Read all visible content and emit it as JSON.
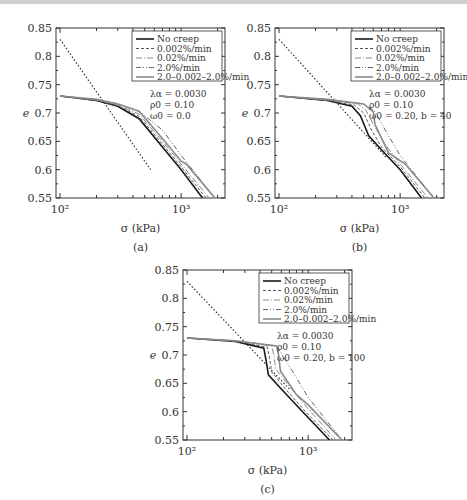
{
  "figure": {
    "panels": [
      {
        "id": "a",
        "caption": "(a)",
        "params": [
          "λα = 0.0030",
          "ρ0 = 0.10",
          "ω0 = 0.0"
        ]
      },
      {
        "id": "b",
        "caption": "(b)",
        "params": [
          "λα = 0.0030",
          "ρ0 = 0.10",
          "ω0 = 0.20, b = 40"
        ]
      },
      {
        "id": "c",
        "caption": "(c)",
        "params": [
          "λα = 0.0030",
          "ρ0 = 0.10",
          "ω0 = 0.20, b = 100"
        ]
      }
    ],
    "xlabel": "σ (kPa)",
    "ylabel": "e",
    "yticks": [
      "0.85",
      "0.8",
      "0.75",
      "0.7",
      "0.65",
      "0.6",
      "0.55"
    ],
    "xticks": [
      "10²",
      "10³"
    ],
    "legend": [
      "No creep",
      "0.002%/min",
      "0.02%/min",
      "2.0%/min",
      "2.0–0.002–2.0%/min"
    ]
  },
  "chart_data": [
    {
      "type": "line",
      "title": "(a) λα = 0.0030, ρ0 = 0.10, ω0 = 0.0",
      "xlabel": "σ (kPa)",
      "ylabel": "e",
      "xscale": "log",
      "xlim": [
        100,
        2300
      ],
      "ylim": [
        0.55,
        0.85
      ],
      "legend_position": "upper right",
      "grid": false,
      "series": [
        {
          "name": "No creep",
          "x": [
            100,
            200,
            300,
            450,
            700,
            1000,
            1500
          ],
          "y": [
            0.73,
            0.722,
            0.712,
            0.69,
            0.64,
            0.6,
            0.55
          ]
        },
        {
          "name": "0.002%/min",
          "x": [
            100,
            200,
            300,
            450,
            700,
            1000,
            1600
          ],
          "y": [
            0.73,
            0.722,
            0.713,
            0.694,
            0.645,
            0.605,
            0.55
          ]
        },
        {
          "name": "0.02%/min",
          "x": [
            100,
            200,
            300,
            450,
            700,
            1000,
            1700
          ],
          "y": [
            0.73,
            0.723,
            0.714,
            0.698,
            0.65,
            0.61,
            0.55
          ]
        },
        {
          "name": "2.0%/min",
          "x": [
            100,
            200,
            300,
            450,
            700,
            1000,
            1900
          ],
          "y": [
            0.73,
            0.724,
            0.716,
            0.703,
            0.67,
            0.625,
            0.55
          ]
        },
        {
          "name": "2.0–0.002–2.0%/min",
          "x": [
            100,
            200,
            300,
            450,
            700,
            1000,
            1100,
            1900
          ],
          "y": [
            0.73,
            0.724,
            0.716,
            0.703,
            0.655,
            0.615,
            0.61,
            0.55
          ]
        }
      ],
      "reference_line": {
        "style": "dotted",
        "x": [
          100,
          560
        ],
        "y": [
          0.83,
          0.6
        ]
      }
    },
    {
      "type": "line",
      "title": "(b) λα = 0.0030, ρ0 = 0.10, ω0 = 0.20, b = 40",
      "xlabel": "σ (kPa)",
      "ylabel": "e",
      "xscale": "log",
      "xlim": [
        100,
        2300
      ],
      "ylim": [
        0.55,
        0.85
      ],
      "legend_position": "upper right",
      "grid": false,
      "series": [
        {
          "name": "No creep",
          "x": [
            100,
            250,
            400,
            470,
            550,
            700,
            1000,
            1500
          ],
          "y": [
            0.73,
            0.722,
            0.712,
            0.695,
            0.66,
            0.635,
            0.6,
            0.55
          ]
        },
        {
          "name": "0.002%/min",
          "x": [
            100,
            250,
            420,
            500,
            580,
            700,
            1000,
            1600
          ],
          "y": [
            0.73,
            0.722,
            0.714,
            0.7,
            0.67,
            0.64,
            0.605,
            0.55
          ]
        },
        {
          "name": "0.02%/min",
          "x": [
            100,
            250,
            450,
            520,
            600,
            750,
            1000,
            1700
          ],
          "y": [
            0.73,
            0.723,
            0.716,
            0.705,
            0.68,
            0.645,
            0.61,
            0.55
          ]
        },
        {
          "name": "2.0%/min",
          "x": [
            100,
            250,
            500,
            620,
            800,
            1000,
            1900
          ],
          "y": [
            0.73,
            0.724,
            0.716,
            0.703,
            0.66,
            0.625,
            0.55
          ]
        },
        {
          "name": "2.0–0.002–2.0%/min",
          "x": [
            100,
            250,
            500,
            600,
            620,
            800,
            1100,
            1900
          ],
          "y": [
            0.73,
            0.724,
            0.716,
            0.702,
            0.68,
            0.63,
            0.61,
            0.55
          ]
        }
      ],
      "reference_line": {
        "style": "dotted",
        "x": [
          100,
          780
        ],
        "y": [
          0.83,
          0.62
        ]
      }
    },
    {
      "type": "line",
      "title": "(c) λα = 0.0030, ρ0 = 0.10, ω0 = 0.20, b = 100",
      "xlabel": "σ (kPa)",
      "ylabel": "e",
      "xscale": "log",
      "xlim": [
        100,
        2300
      ],
      "ylim": [
        0.55,
        0.85
      ],
      "legend_position": "upper right",
      "grid": false,
      "series": [
        {
          "name": "No creep",
          "x": [
            100,
            250,
            430,
            450,
            470,
            600,
            900,
            1500
          ],
          "y": [
            0.73,
            0.724,
            0.712,
            0.69,
            0.665,
            0.64,
            0.6,
            0.55
          ]
        },
        {
          "name": "0.002%/min",
          "x": [
            100,
            250,
            460,
            480,
            500,
            650,
            950,
            1600
          ],
          "y": [
            0.73,
            0.724,
            0.714,
            0.695,
            0.67,
            0.64,
            0.6,
            0.55
          ]
        },
        {
          "name": "0.02%/min",
          "x": [
            100,
            250,
            500,
            520,
            540,
            700,
            1000,
            1700
          ],
          "y": [
            0.73,
            0.725,
            0.716,
            0.7,
            0.675,
            0.645,
            0.605,
            0.55
          ]
        },
        {
          "name": "2.0%/min",
          "x": [
            100,
            250,
            550,
            800,
            1000,
            1900
          ],
          "y": [
            0.73,
            0.725,
            0.716,
            0.66,
            0.625,
            0.55
          ]
        },
        {
          "name": "2.0–0.002–2.0%/min",
          "x": [
            100,
            250,
            550,
            570,
            590,
            800,
            1000,
            1900
          ],
          "y": [
            0.73,
            0.725,
            0.716,
            0.7,
            0.672,
            0.63,
            0.612,
            0.55
          ]
        }
      ],
      "reference_line": {
        "style": "dotted",
        "x": [
          100,
          700
        ],
        "y": [
          0.83,
          0.64
        ]
      }
    }
  ]
}
